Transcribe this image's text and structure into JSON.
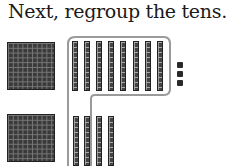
{
  "title": "Next, regroup the tens.",
  "blocks": {
    "hundreds_count": 2,
    "tens_top_row_count": 8,
    "tens_bottom_row_count": 4,
    "ones_count": 3,
    "grouped_tens_count": 10
  },
  "colors": {
    "block_fill": "#3a3a3a",
    "outline": "#9a9a9a"
  }
}
